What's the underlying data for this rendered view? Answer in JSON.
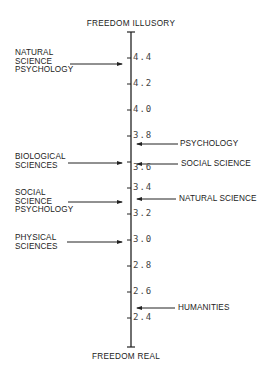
{
  "diagram": {
    "top_label": "FREEDOM ILLUSORY",
    "bottom_label": "FREEDOM REAL",
    "axis": {
      "min": 2.4,
      "max": 4.4,
      "ticks": [
        "4.4",
        "4.2",
        "4.0",
        "3.8",
        "3.6",
        "3.4",
        "3.2",
        "3.0",
        "2.8",
        "2.6",
        "2.4"
      ]
    },
    "left_items": [
      {
        "lines": [
          "NATURAL",
          "SCIENCE",
          "PSYCHOLOGY"
        ],
        "value": 4.35
      },
      {
        "lines": [
          "BIOLOGICAL",
          "SCIENCES"
        ],
        "value": 3.6
      },
      {
        "lines": [
          "SOCIAL",
          "SCIENCE",
          "PSYCHOLOGY"
        ],
        "value": 3.3
      },
      {
        "lines": [
          "PHYSICAL",
          "SCIENCES"
        ],
        "value": 3.0
      }
    ],
    "right_items": [
      {
        "label": "PSYCHOLOGY",
        "value": 3.74
      },
      {
        "label": "SOCIAL SCIENCE",
        "value": 3.59
      },
      {
        "label": "NATURAL SCIENCE",
        "value": 3.35
      },
      {
        "label": "HUMANITIES",
        "value": 2.5
      }
    ],
    "colors": {
      "ink": "#222222",
      "background": "#ffffff"
    }
  }
}
